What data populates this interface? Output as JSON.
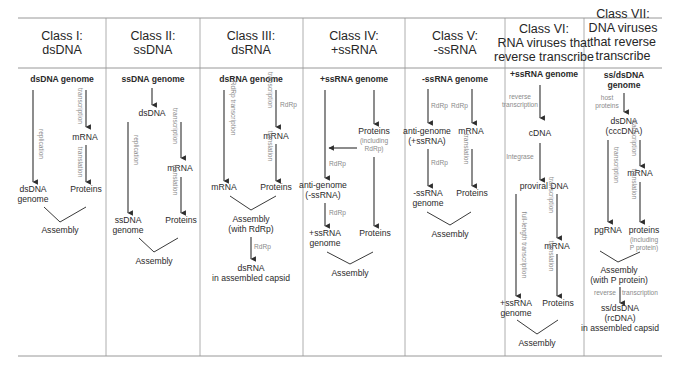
{
  "classes": [
    {
      "id": "class-1",
      "header": [
        "Class I:",
        "dsDNA"
      ],
      "genome": "dsDNA genome",
      "nodes": {
        "mrna": "mRNA",
        "proteins": "Proteins",
        "progeny": [
          "dsDNA",
          "genome"
        ],
        "assembly": "Assembly"
      },
      "labels": {
        "replication": "replication",
        "transcription": "transcription",
        "translation": "translation"
      }
    },
    {
      "id": "class-2",
      "header": [
        "Class II:",
        "ssDNA"
      ],
      "genome": "ssDNA genome",
      "nodes": {
        "dsdna": "dsDNA",
        "mrna": "mRNA",
        "proteins": "Proteins",
        "progeny": [
          "ssDNA",
          "genome"
        ],
        "assembly": "Assembly"
      },
      "labels": {
        "replication": "replication",
        "transcription": "transcription",
        "translation": "translation"
      }
    },
    {
      "id": "class-3",
      "header": [
        "Class III:",
        "dsRNA"
      ],
      "genome": "dsRNA genome",
      "nodes": {
        "mrna_left": "mRNA",
        "mrna_right": "mRNA",
        "proteins": "Proteins",
        "assembly": [
          "Assembly",
          "(with RdRp)"
        ],
        "final": [
          "dsRNA",
          "in assembled capsid"
        ]
      },
      "labels": {
        "rdrp_transcription": "RdRp transcription",
        "transcription": "transcription",
        "rdrp": "RdRp",
        "translation": "translation",
        "rdrp_final": "RdRp"
      }
    },
    {
      "id": "class-4",
      "header": [
        "Class IV:",
        "+ssRNA"
      ],
      "genome": "+ssRNA genome",
      "nodes": {
        "proteins_rdrp": [
          "Proteins",
          "(including",
          "RdRp)"
        ],
        "antigenome": [
          "anti-genome",
          "(-ssRNA)"
        ],
        "progeny": [
          "+ssRNA",
          "genome"
        ],
        "proteins": "Proteins",
        "assembly": "Assembly"
      },
      "labels": {
        "rdrp_1": "RdRp",
        "rdrp_2": "RdRp"
      }
    },
    {
      "id": "class-5",
      "header": [
        "Class V:",
        "-ssRNA"
      ],
      "genome": "-ssRNA genome",
      "nodes": {
        "antigenome": [
          "anti-genome",
          "(+ssRNA)"
        ],
        "mrna": "mRNA",
        "progeny": [
          "-ssRNA",
          "genome"
        ],
        "proteins": "Proteins",
        "assembly": "Assembly"
      },
      "labels": {
        "rdrp_left": "RdRp",
        "rdrp_right": "RdRp",
        "rdrp_lower": "RdRp",
        "translation": "translation"
      }
    },
    {
      "id": "class-6",
      "header": [
        "Class VI:",
        "RNA viruses that",
        "reverse transcribe"
      ],
      "genome": "+ssRNA genome",
      "nodes": {
        "cdna": "cDNA",
        "proviral": "proviral DNA",
        "mrna": "mRNA",
        "progeny": [
          "+ssRNA",
          "genome"
        ],
        "proteins": "Proteins",
        "assembly": "Assembly"
      },
      "labels": {
        "reverse_transcription": [
          "reverse",
          "transcription"
        ],
        "integrase": "Integrase",
        "full_length": "full-length transcription",
        "transcription": "transcription",
        "translation": "translation"
      }
    },
    {
      "id": "class-7",
      "header": [
        "Class VII:",
        "DNA viruses",
        "that reverse",
        "transcribe"
      ],
      "genome": [
        "ss/dsDNA",
        "genome"
      ],
      "nodes": {
        "cccdna": [
          "dsDNA",
          "(cccDNA)"
        ],
        "mrna": "mRNA",
        "pgrna": "pgRNA",
        "proteins": [
          "proteins",
          "(including",
          "P protein)"
        ],
        "assembly": [
          "Assembly",
          "(with P protein)"
        ],
        "final": [
          "ss/dsDNA",
          "(rcDNA)",
          "in assembled capsid"
        ]
      },
      "labels": {
        "host_proteins": [
          "host",
          "proteins"
        ],
        "transcription_left": "transcription",
        "transcription_right": "transcription",
        "translation": "translation",
        "reverse": "reverse",
        "transcription_rt": "transcription"
      }
    }
  ]
}
